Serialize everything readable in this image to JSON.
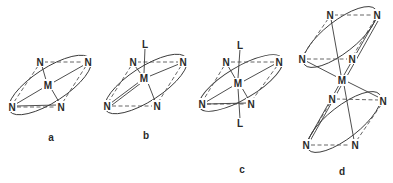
{
  "figure": {
    "panels": [
      {
        "id": "a",
        "label": "a",
        "metal": "M",
        "donors": [
          "N",
          "N",
          "N",
          "N"
        ],
        "axial_ligands": []
      },
      {
        "id": "b",
        "label": "b",
        "metal": "M",
        "donors": [
          "N",
          "N",
          "N",
          "N"
        ],
        "axial_ligands": [
          "L"
        ]
      },
      {
        "id": "c",
        "label": "c",
        "metal": "M",
        "donors": [
          "N",
          "N",
          "N",
          "N"
        ],
        "axial_ligands": [
          "L",
          "L"
        ]
      },
      {
        "id": "d",
        "label": "d",
        "metal": "M",
        "donors": [
          "N",
          "N",
          "N",
          "N",
          "N",
          "N",
          "N",
          "N"
        ],
        "axial_ligands": []
      }
    ],
    "atom_symbols": {
      "metal": "M",
      "nitrogen": "N",
      "ligand": "L"
    }
  }
}
